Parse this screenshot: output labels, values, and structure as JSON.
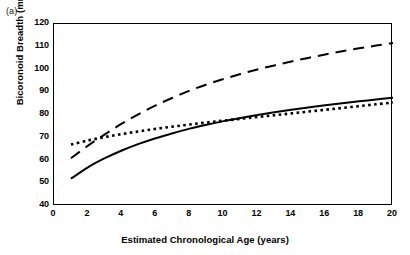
{
  "figure": {
    "panel_label": "(a)"
  },
  "chart_data": {
    "type": "line",
    "title": "",
    "xlabel": "Estimated Chronological Age (years)",
    "ylabel": "Bicoronoid Breadth (mm)",
    "xlim": [
      0,
      20
    ],
    "ylim": [
      40,
      120
    ],
    "xticks": [
      0,
      2,
      4,
      6,
      8,
      10,
      12,
      14,
      16,
      18,
      20
    ],
    "yticks": [
      40,
      50,
      60,
      70,
      80,
      90,
      100,
      110,
      120
    ],
    "grid": false,
    "legend": "none",
    "x": [
      1,
      2,
      3,
      4,
      5,
      6,
      7,
      8,
      9,
      10,
      11,
      12,
      13,
      14,
      15,
      16,
      17,
      18,
      19,
      20
    ],
    "series": [
      {
        "name": "solid-curve",
        "style": "solid",
        "color": "#000000",
        "values": [
          52.0,
          57.0,
          61.0,
          64.4,
          67.3,
          69.8,
          72.0,
          74.0,
          75.7,
          77.3,
          78.7,
          80.0,
          81.2,
          82.3,
          83.3,
          84.3,
          85.2,
          86.0,
          86.8,
          87.6
        ]
      },
      {
        "name": "long-dashed-curve",
        "style": "dashed",
        "color": "#000000",
        "values": [
          61.0,
          66.5,
          71.5,
          76.2,
          80.4,
          84.2,
          87.6,
          90.7,
          93.4,
          95.8,
          98.0,
          100.0,
          101.8,
          103.5,
          105.1,
          106.6,
          108.0,
          109.3,
          110.5,
          111.6
        ]
      },
      {
        "name": "dotted-curve",
        "style": "dotted",
        "color": "#000000",
        "values": [
          67.0,
          68.8,
          70.3,
          71.6,
          72.8,
          73.9,
          74.9,
          75.8,
          76.7,
          77.5,
          78.3,
          79.1,
          79.9,
          80.7,
          81.5,
          82.3,
          83.1,
          83.9,
          84.7,
          85.5
        ]
      }
    ]
  }
}
